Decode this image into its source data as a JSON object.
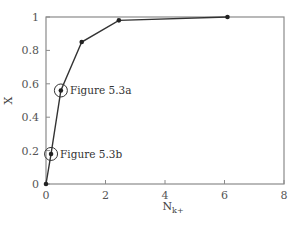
{
  "chart_data": {
    "type": "line",
    "title": "",
    "xlabel": "N",
    "xlabel_subscript": "k+",
    "ylabel": "X",
    "xlim": [
      0,
      8
    ],
    "ylim": [
      0,
      1
    ],
    "xticks": [
      0,
      2,
      4,
      6,
      8
    ],
    "yticks": [
      0,
      0.2,
      0.4,
      0.6,
      0.8,
      1
    ],
    "xtick_labels": [
      "0",
      "2",
      "4",
      "6",
      "8"
    ],
    "ytick_labels": [
      "0",
      "0.2",
      "0.4",
      "0.6",
      "0.8",
      "1"
    ],
    "grid": false,
    "legend": null,
    "series": [
      {
        "name": "X vs N_k+",
        "x": [
          0,
          0.17,
          0.5,
          1.2,
          2.45,
          6.1
        ],
        "values": [
          0,
          0.18,
          0.56,
          0.85,
          0.98,
          1.0
        ]
      }
    ],
    "annotations": [
      {
        "text": "Figure 5.3a",
        "x": 0.5,
        "y": 0.56,
        "circled": true
      },
      {
        "text": "Figure 5.3b",
        "x": 0.17,
        "y": 0.18,
        "circled": true
      }
    ]
  }
}
